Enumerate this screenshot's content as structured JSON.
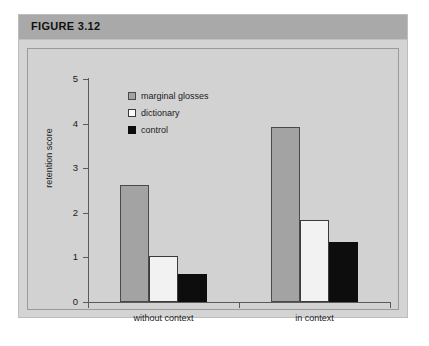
{
  "figure": {
    "title": "FIGURE 3.12",
    "title_bar_color": "#a9a9a9",
    "plot_background_color": "#d2d2d2"
  },
  "chart_data": {
    "type": "bar",
    "title": "FIGURE 3.12",
    "xlabel": "",
    "ylabel": "retention score",
    "categories": [
      "without context",
      "in context"
    ],
    "series": [
      {
        "name": "marginal glosses",
        "color": "#a3a3a3",
        "values": [
          2.62,
          3.93
        ]
      },
      {
        "name": "dictionary",
        "color": "#f2f2f2",
        "values": [
          1.03,
          1.83
        ]
      },
      {
        "name": "control",
        "color": "#0d0d0d",
        "values": [
          0.62,
          1.35
        ]
      }
    ],
    "ylim": [
      0,
      5
    ],
    "yticks": [
      "0",
      "1",
      "2",
      "3",
      "4",
      "5"
    ],
    "grid": false,
    "legend_position": "top-center-inside"
  }
}
